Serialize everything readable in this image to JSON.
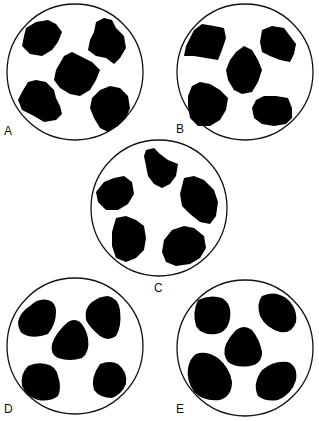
{
  "figure": {
    "panels": [
      {
        "id": "A",
        "label": "A",
        "description": "angular particles"
      },
      {
        "id": "B",
        "label": "B",
        "description": "subangular particles"
      },
      {
        "id": "C",
        "label": "C",
        "description": "subangular-subrounded particles"
      },
      {
        "id": "D",
        "label": "D",
        "description": "subrounded particles"
      },
      {
        "id": "E",
        "label": "E",
        "description": "rounded particles"
      }
    ],
    "colors": {
      "particle": "#000000",
      "outline": "#111111",
      "background": "#ffffff"
    }
  }
}
